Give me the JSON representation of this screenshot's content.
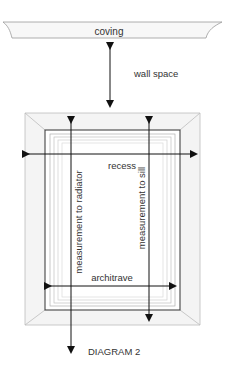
{
  "diagram": {
    "title": "DIAGRAM 2",
    "labels": {
      "coving": "coving",
      "wall_space": "wall space",
      "recess": "recess",
      "measurement_to_radiator": "measurement to radiator",
      "measurement_to_sill": "measurement to sill",
      "architrave": "architrave"
    },
    "colors": {
      "line": "#1a1a1a",
      "frame_fill": "#f2f2f2",
      "coving_fill": "#f7f7f7",
      "text": "#333333"
    }
  }
}
